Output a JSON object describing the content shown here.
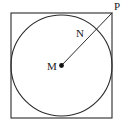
{
  "figure": {
    "type": "geometry-diagram",
    "background_color": "#ffffff",
    "stroke_color": "#2b2b2b",
    "labels": {
      "center": "M",
      "intersection": "N",
      "corner": "P"
    },
    "square": {
      "x": 11,
      "y": 13,
      "width": 101,
      "height": 105,
      "stroke_width": 1.1
    },
    "circle": {
      "cx": 61.5,
      "cy": 65.5,
      "r": 50.5,
      "stroke_width": 1.1
    },
    "center_dot": {
      "cx": 61.5,
      "cy": 65.5,
      "r": 2.4
    },
    "segment_MP": {
      "x1": 61.5,
      "y1": 65.5,
      "x2": 112,
      "y2": 13,
      "stroke_width": 1.0
    },
    "point_N": {
      "cx": 96.5,
      "cy": 29.6
    }
  }
}
